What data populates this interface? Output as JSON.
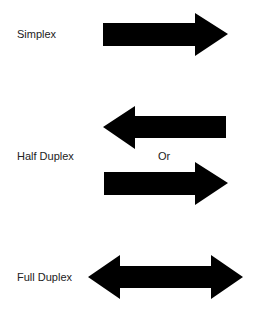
{
  "diagram": {
    "type": "transmission-modes",
    "rows": [
      {
        "id": "simplex",
        "label": "Simplex",
        "arrows": [
          "right"
        ]
      },
      {
        "id": "half-duplex",
        "label": "Half Duplex",
        "arrows": [
          "left",
          "right"
        ],
        "separator": "Or"
      },
      {
        "id": "full-duplex",
        "label": "Full Duplex",
        "arrows": [
          "both"
        ]
      }
    ],
    "colors": {
      "arrow": "#000000",
      "text": "#222222",
      "background": "#ffffff"
    }
  }
}
